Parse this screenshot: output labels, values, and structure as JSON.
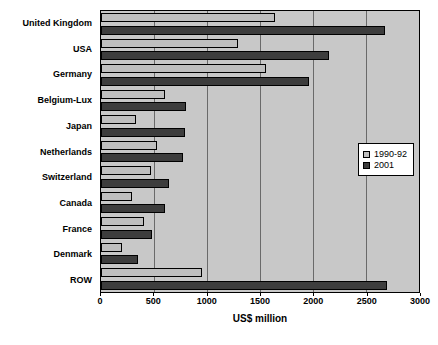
{
  "chart_data": {
    "type": "bar",
    "orientation": "horizontal",
    "title": "",
    "xlabel": "US$ million",
    "ylabel": "",
    "xlim": [
      0,
      3000
    ],
    "xticks": [
      0,
      500,
      1000,
      1500,
      2000,
      2500,
      3000
    ],
    "grid": true,
    "legend_position": "right-middle",
    "categories": [
      "United Kingdom",
      "USA",
      "Germany",
      "Belgium-Lux",
      "Japan",
      "Netherlands",
      "Switzerland",
      "Canada",
      "France",
      "Denmark",
      "ROW"
    ],
    "series": [
      {
        "name": "1990-92",
        "color": "#bfbfbf",
        "values": [
          1640,
          1290,
          1560,
          600,
          330,
          530,
          470,
          290,
          410,
          200,
          950
        ]
      },
      {
        "name": "2001",
        "color": "#3d3d3d",
        "values": [
          2680,
          2150,
          1960,
          800,
          790,
          770,
          640,
          600,
          480,
          350,
          2700
        ]
      }
    ]
  },
  "colors": {
    "plot_background": "#c8c8c8",
    "page_background": "#ffffff",
    "gridline": "#6a6a6a",
    "axis": "#000000",
    "series_1990_92": "#bfbfbf",
    "series_2001": "#3d3d3d"
  }
}
